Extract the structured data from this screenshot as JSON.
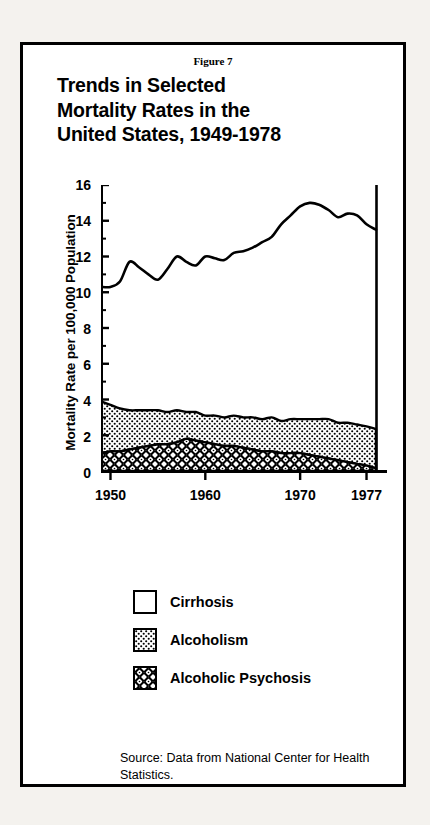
{
  "figure": {
    "number_label": "Figure 7",
    "title_lines": [
      "Trends in Selected",
      "Mortality Rates in the",
      "United States, 1949-1978"
    ],
    "source_note": "Source: Data from National Center for Health Statistics."
  },
  "legend": {
    "items": [
      {
        "label": "Cirrhosis",
        "pattern": "none",
        "swatch_name": "legend-swatch-cirrhosis"
      },
      {
        "label": "Alcoholism",
        "pattern": "fine-dots",
        "swatch_name": "legend-swatch-alcoholism"
      },
      {
        "label": "Alcoholic Psychosis",
        "pattern": "dense-rings",
        "swatch_name": "legend-swatch-alcoholic-psychosis"
      }
    ]
  },
  "axes": {
    "y_label": "Mortality Rate per 100,000 Population",
    "y_ticks": [
      0,
      2,
      4,
      6,
      8,
      10,
      12,
      14,
      16
    ],
    "y_minor_ticks": [
      1,
      3,
      5,
      7,
      9,
      11,
      13,
      15
    ],
    "x_ticks": [
      1950,
      1960,
      1970,
      1977
    ]
  },
  "colors": {
    "ink": "#000000",
    "paper": "#ffffff",
    "page": "#f4f2ee"
  },
  "chart_data": {
    "type": "line",
    "title": "Trends in Selected Mortality Rates in the United States, 1949-1978",
    "xlabel": "",
    "ylabel": "Mortality Rate per 100,000 Population",
    "xlim": [
      1949,
      1978
    ],
    "ylim": [
      0,
      16
    ],
    "grid": false,
    "legend_position": "below-plot",
    "x": [
      1949,
      1950,
      1951,
      1952,
      1953,
      1954,
      1955,
      1956,
      1957,
      1958,
      1959,
      1960,
      1961,
      1962,
      1963,
      1964,
      1965,
      1966,
      1967,
      1968,
      1969,
      1970,
      1971,
      1972,
      1973,
      1974,
      1975,
      1976,
      1977,
      1978
    ],
    "series": [
      {
        "name": "Cirrhosis",
        "style": "line",
        "values": [
          10.3,
          10.3,
          10.6,
          11.7,
          11.4,
          11.0,
          10.7,
          11.3,
          12.0,
          11.7,
          11.5,
          12.0,
          11.9,
          11.8,
          12.2,
          12.3,
          12.5,
          12.8,
          13.1,
          13.8,
          14.3,
          14.8,
          15.0,
          14.9,
          14.6,
          14.2,
          14.4,
          14.3,
          13.8,
          13.5
        ]
      },
      {
        "name": "Alcoholism",
        "style": "stacked-area",
        "values": [
          2.9,
          2.6,
          2.4,
          2.2,
          2.1,
          2.0,
          1.9,
          1.8,
          1.8,
          1.5,
          1.6,
          1.5,
          1.6,
          1.6,
          1.7,
          1.7,
          1.8,
          1.8,
          1.9,
          1.8,
          1.9,
          1.9,
          2.0,
          2.1,
          2.2,
          2.1,
          2.2,
          2.2,
          2.2,
          2.2
        ]
      },
      {
        "name": "Alcoholic Psychosis",
        "style": "stacked-area",
        "values": [
          1.0,
          1.1,
          1.1,
          1.2,
          1.3,
          1.4,
          1.5,
          1.5,
          1.6,
          1.8,
          1.7,
          1.6,
          1.5,
          1.4,
          1.4,
          1.3,
          1.2,
          1.1,
          1.1,
          1.0,
          1.0,
          1.0,
          0.9,
          0.8,
          0.7,
          0.6,
          0.5,
          0.4,
          0.3,
          0.15
        ]
      }
    ],
    "stacked_total": [
      3.9,
      3.7,
      3.5,
      3.4,
      3.4,
      3.4,
      3.4,
      3.3,
      3.4,
      3.3,
      3.3,
      3.1,
      3.1,
      3.0,
      3.1,
      3.0,
      3.0,
      2.9,
      3.0,
      2.8,
      2.9,
      2.9,
      2.9,
      2.9,
      2.9,
      2.7,
      2.7,
      2.6,
      2.5,
      2.35
    ]
  }
}
